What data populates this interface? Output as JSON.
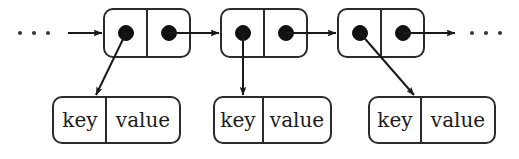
{
  "diagram": {
    "colors": {
      "background": "#ffffff",
      "stroke": "#2b2b2b",
      "line": "#1a1a1a",
      "dot": "#111111",
      "text": "#1a1a1a"
    },
    "ellipsis": {
      "left": "...",
      "right": "...",
      "dot_count": 3
    },
    "nodes": [
      {
        "id": "node-1",
        "left_cell_name": "data-pointer-cell",
        "right_cell_name": "next-pointer-cell",
        "data_pointer": "filled-dot",
        "next_pointer": "filled-dot",
        "link_style": "diagonal-down-left"
      },
      {
        "id": "node-2",
        "left_cell_name": "data-pointer-cell",
        "right_cell_name": "next-pointer-cell",
        "data_pointer": "filled-dot",
        "next_pointer": "filled-dot",
        "link_style": "vertical-down"
      },
      {
        "id": "node-3",
        "left_cell_name": "data-pointer-cell",
        "right_cell_name": "next-pointer-cell",
        "data_pointer": "filled-dot",
        "next_pointer": "filled-dot",
        "link_style": "diagonal-down-right"
      }
    ],
    "entries": [
      {
        "id": "entry-1",
        "key_label": "key",
        "value_label": "value"
      },
      {
        "id": "entry-2",
        "key_label": "key",
        "value_label": "value"
      },
      {
        "id": "entry-3",
        "key_label": "key",
        "value_label": "value"
      }
    ],
    "arrows": {
      "incoming_label": "incoming-chain-arrow",
      "outgoing_label": "outgoing-chain-arrow",
      "node_link_label": "next-pointer-arrow",
      "entry_link_label": "entry-pointer-arrow"
    }
  }
}
